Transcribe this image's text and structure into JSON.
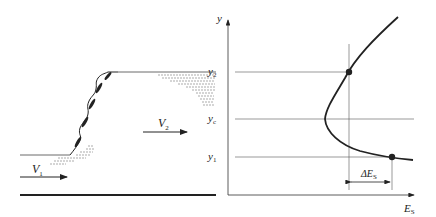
{
  "left_figure": {
    "upstream_velocity": {
      "symbol": "V",
      "subscript": "1"
    },
    "downstream_velocity": {
      "symbol": "V",
      "subscript": "2"
    }
  },
  "right_figure": {
    "y_axis_label": "y",
    "x_axis_label": {
      "symbol": "E",
      "subscript": "S"
    },
    "levels": [
      {
        "symbol": "y",
        "subscript": "2"
      },
      {
        "symbol": "y",
        "subscript": "c"
      },
      {
        "symbol": "y",
        "subscript": "1"
      }
    ],
    "delta_label": {
      "symbol": "ΔE",
      "subscript": "S"
    }
  },
  "colors": {
    "ink": "#222222",
    "background": "#ffffff"
  }
}
